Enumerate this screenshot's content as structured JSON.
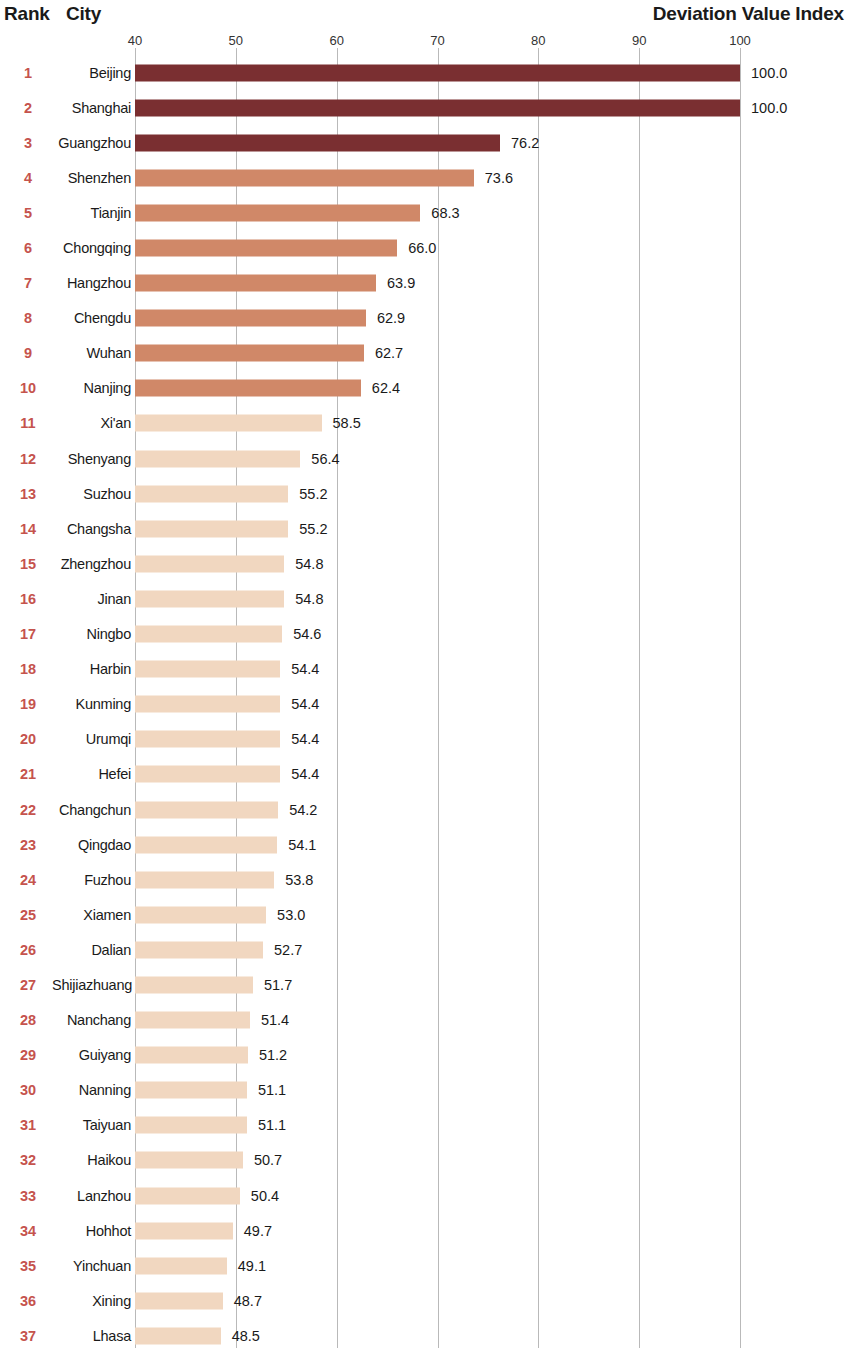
{
  "header": {
    "rank_label": "Rank",
    "city_label": "City",
    "index_label": "Deviation Value Index"
  },
  "colors": {
    "tier1": "#7a2f31",
    "tier2": "#d08868",
    "tier3": "#f1d7c0",
    "rank_text": "#c5534d",
    "city_text": "#1a1a1a",
    "value_text": "#1a1a1a",
    "gridline": "#b9b9b9",
    "background": "#ffffff"
  },
  "chart_data": {
    "type": "bar",
    "orientation": "horizontal",
    "title": "Deviation Value Index",
    "xlabel": "Deviation Value Index",
    "ylabel": "City",
    "xlim": [
      40,
      100
    ],
    "xticks": [
      40,
      50,
      60,
      70,
      80,
      90,
      100
    ],
    "grid": true,
    "legend": "none",
    "categories": [
      "Beijing",
      "Shanghai",
      "Guangzhou",
      "Shenzhen",
      "Tianjin",
      "Chongqing",
      "Hangzhou",
      "Chengdu",
      "Wuhan",
      "Nanjing",
      "Xi'an",
      "Shenyang",
      "Suzhou",
      "Changsha",
      "Zhengzhou",
      "Jinan",
      "Ningbo",
      "Harbin",
      "Kunming",
      "Urumqi",
      "Hefei",
      "Changchun",
      "Qingdao",
      "Fuzhou",
      "Xiamen",
      "Dalian",
      "Shijiazhuang",
      "Nanchang",
      "Guiyang",
      "Nanning",
      "Taiyuan",
      "Haikou",
      "Lanzhou",
      "Hohhot",
      "Yinchuan",
      "Xining",
      "Lhasa"
    ],
    "values": [
      100.0,
      100.0,
      76.2,
      73.6,
      68.3,
      66.0,
      63.9,
      62.9,
      62.7,
      62.4,
      58.5,
      56.4,
      55.2,
      55.2,
      54.8,
      54.8,
      54.6,
      54.4,
      54.4,
      54.4,
      54.4,
      54.2,
      54.1,
      53.8,
      53.0,
      52.7,
      51.7,
      51.4,
      51.2,
      51.1,
      51.1,
      50.7,
      50.4,
      49.7,
      49.1,
      48.7,
      48.5
    ],
    "ranks": [
      1,
      2,
      3,
      4,
      5,
      6,
      7,
      8,
      9,
      10,
      11,
      12,
      13,
      14,
      15,
      16,
      17,
      18,
      19,
      20,
      21,
      22,
      23,
      24,
      25,
      26,
      27,
      28,
      29,
      30,
      31,
      32,
      33,
      34,
      35,
      36,
      37
    ],
    "value_labels": [
      "100.0",
      "100.0",
      "76.2",
      "73.6",
      "68.3",
      "66.0",
      "63.9",
      "62.9",
      "62.7",
      "62.4",
      "58.5",
      "56.4",
      "55.2",
      "55.2",
      "54.8",
      "54.8",
      "54.6",
      "54.4",
      "54.4",
      "54.4",
      "54.4",
      "54.2",
      "54.1",
      "53.8",
      "53.0",
      "52.7",
      "51.7",
      "51.4",
      "51.2",
      "51.1",
      "51.1",
      "50.7",
      "50.4",
      "49.7",
      "49.1",
      "48.7",
      "48.5"
    ],
    "tick_labels": [
      "40",
      "50",
      "60",
      "70",
      "80",
      "90",
      "100"
    ],
    "color_tiers": [
      {
        "name": "tier1",
        "ranks": [
          1,
          3
        ],
        "color": "#7a2f31"
      },
      {
        "name": "tier2",
        "ranks": [
          4,
          10
        ],
        "color": "#d08868"
      },
      {
        "name": "tier3",
        "ranks": [
          11,
          37
        ],
        "color": "#f1d7c0"
      }
    ]
  }
}
